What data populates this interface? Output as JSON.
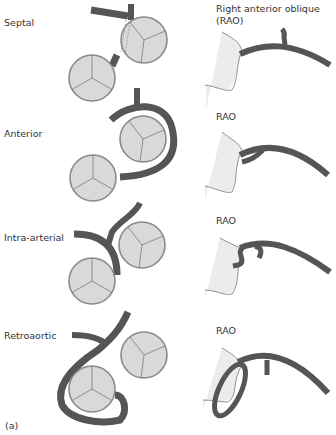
{
  "figure_label": "(a)",
  "colors": {
    "vessel": "#555555",
    "valve_fill": "#d9d9d9",
    "valve_stroke": "#8a8a8a",
    "heart_outline": "#777777",
    "heart_shade": "#ececec"
  },
  "rows": [
    {
      "id": "septal",
      "label": "Septal",
      "view_label": "Right anterior oblique (RAO)",
      "view_line1": "Right anterior oblique",
      "view_line2": "(RAO)"
    },
    {
      "id": "anterior",
      "label": "Anterior",
      "view_label": "RAO"
    },
    {
      "id": "intra-arterial",
      "label": "Intra-arterial",
      "view_label": "RAO"
    },
    {
      "id": "retroaortic",
      "label": "Retroaortic",
      "view_label": "RAO"
    }
  ]
}
